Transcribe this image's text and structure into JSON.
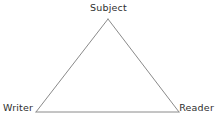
{
  "diagram": {
    "type": "triangle-diagram",
    "background_color": "#ffffff",
    "line_color": "#8a8a8a",
    "text_color": "#2e2e2e",
    "line_width": 1,
    "vertices": [
      {
        "id": "subject",
        "label": "Subject",
        "x": 108,
        "y": 19,
        "position": "apex"
      },
      {
        "id": "writer",
        "label": "Writer",
        "x": 36,
        "y": 112,
        "position": "bottom-left"
      },
      {
        "id": "reader",
        "label": "Reader",
        "x": 179,
        "y": 112,
        "position": "bottom-right"
      }
    ],
    "edges": [
      {
        "id": "writer-subject",
        "from": "writer",
        "to": "subject"
      },
      {
        "id": "subject-reader",
        "from": "subject",
        "to": "reader"
      },
      {
        "id": "writer-reader",
        "from": "writer",
        "to": "reader"
      }
    ]
  }
}
